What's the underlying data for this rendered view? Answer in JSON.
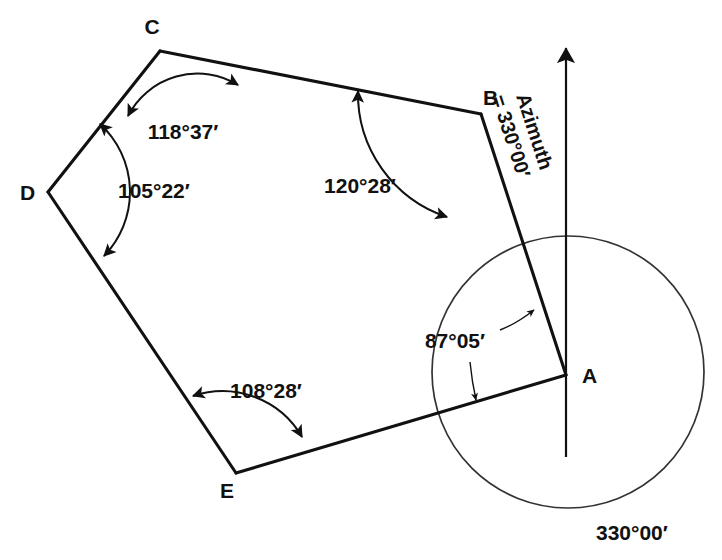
{
  "figure": {
    "type": "surveying-traverse-diagram",
    "shape": "closed five-sided traverse",
    "background_color": "#ffffff",
    "line_color": "#111111"
  },
  "vertices": [
    {
      "id": "A",
      "label": "A",
      "x": 566,
      "y": 375,
      "label_x": 582,
      "label_y": 383
    },
    {
      "id": "B",
      "label": "B",
      "x": 481,
      "y": 114,
      "label_x": 483,
      "label_y": 105
    },
    {
      "id": "C",
      "label": "C",
      "x": 160,
      "y": 51,
      "label_x": 152,
      "label_y": 34
    },
    {
      "id": "D",
      "label": "D",
      "x": 48,
      "y": 192,
      "label_x": 20,
      "label_y": 200
    },
    {
      "id": "E",
      "label": "E",
      "x": 236,
      "y": 473,
      "label_x": 227,
      "label_y": 498
    }
  ],
  "edges": [
    {
      "from": "A",
      "to": "B"
    },
    {
      "from": "B",
      "to": "C"
    },
    {
      "from": "C",
      "to": "D"
    },
    {
      "from": "D",
      "to": "E"
    },
    {
      "from": "E",
      "to": "A"
    }
  ],
  "angles": [
    {
      "vertex": "A",
      "value": "87°05′",
      "label_x": 455,
      "label_y": 348
    },
    {
      "vertex": "B",
      "value": "120°28′",
      "label_x": 360,
      "label_y": 193
    },
    {
      "vertex": "C",
      "value": "118°37′",
      "label_x": 183,
      "label_y": 139
    },
    {
      "vertex": "D",
      "value": "105°22′",
      "label_x": 118,
      "label_y": 198
    },
    {
      "vertex": "E",
      "value": "108°28′",
      "label_x": 266,
      "label_y": 398
    }
  ],
  "meridian": {
    "name": "north-meridian",
    "top_x": 566,
    "top_y": 45,
    "bottom_x": 566,
    "bottom_y": 457,
    "arrowhead": "north-arrow"
  },
  "azimuth": {
    "line1": "Azimuth",
    "line2": "= 330°00′",
    "anchor_x": 528,
    "anchor_y": 100,
    "rotation_deg": 72
  },
  "reference_circle": {
    "center_x": 568,
    "center_y": 372,
    "radius": 136,
    "label": "330°00′",
    "label_x": 596,
    "label_y": 540
  }
}
